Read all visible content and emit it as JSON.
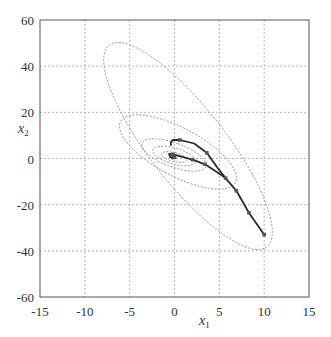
{
  "chart_data": {
    "type": "line",
    "title": "",
    "xlabel": "x1",
    "ylabel": "x2",
    "xlim": [
      -15,
      15
    ],
    "ylim": [
      -60,
      60
    ],
    "xticks": [
      -15,
      -10,
      -5,
      0,
      5,
      10,
      15
    ],
    "yticks": [
      -60,
      -40,
      -20,
      0,
      20,
      40,
      60
    ],
    "grid": true,
    "legend": null,
    "contours": [
      {
        "cx": 1.5,
        "cy": 4.5,
        "rx": 5.2,
        "ry": 54,
        "angle_note": "largest tilted ellipse"
      },
      {
        "cx": 0.3,
        "cy": 3,
        "rx": 3.2,
        "ry": 24
      },
      {
        "cx": 0.0,
        "cy": 1.5,
        "rx": 1.8,
        "ry": 12
      },
      {
        "cx": -0.1,
        "cy": 1,
        "rx": 1.2,
        "ry": 7
      },
      {
        "cx": -0.1,
        "cy": 0.8,
        "rx": 0.7,
        "ry": 4
      }
    ],
    "series": [
      {
        "name": "trajectory-1",
        "x": [
          10,
          8.3,
          6.9,
          5.7,
          4.8,
          3.6,
          2.2,
          0.6,
          -0.2,
          -0.4,
          -0.4
        ],
        "y": [
          -33,
          -23.5,
          -14,
          -8.5,
          -4,
          2.5,
          6.5,
          8,
          8,
          7,
          5.5
        ]
      },
      {
        "name": "trajectory-2",
        "x": [
          5.7,
          4.6,
          3.4,
          2.0,
          0.8,
          -0.2,
          -0.6,
          -0.5,
          -0.2,
          0.0,
          -0.3
        ],
        "y": [
          -8.5,
          -5.5,
          -2.5,
          -0.5,
          0.8,
          1.8,
          2,
          0.8,
          0,
          0.5,
          1
        ]
      }
    ],
    "markers": [
      {
        "x": 10,
        "y": -33
      },
      {
        "x": 8.3,
        "y": -23.5
      },
      {
        "x": 6.9,
        "y": -14
      },
      {
        "x": 5.7,
        "y": -8.5
      },
      {
        "x": 3.4,
        "y": -2.5
      },
      {
        "x": 2.0,
        "y": -0.5
      },
      {
        "x": 0.6,
        "y": 8
      },
      {
        "x": 3.6,
        "y": 2.5
      },
      {
        "x": -0.2,
        "y": 1.8
      },
      {
        "x": 0.0,
        "y": 0.5
      }
    ]
  },
  "axes": {
    "x_label_main": "x",
    "x_label_sub": "1",
    "y_label_main": "x",
    "y_label_sub": "2"
  },
  "colors": {
    "grid": "#9a9a9a",
    "contour": "#8a8a8a",
    "trajectory": "#2a2a2a",
    "frame": "#555555",
    "text": "#333333"
  }
}
